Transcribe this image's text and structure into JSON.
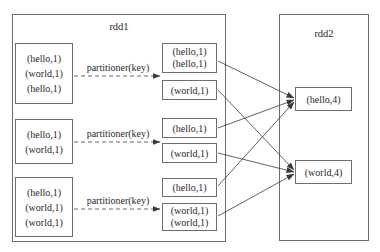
{
  "rdd1": {
    "title": "rdd1",
    "input_partitions": [
      {
        "records": [
          "(hello,1)",
          "(world,1)",
          "(hello,1)"
        ]
      },
      {
        "records": [
          "(hello,1)",
          "(world,1)"
        ]
      },
      {
        "records": [
          "(hello,1)",
          "(world,1)",
          "(world,1)"
        ]
      }
    ],
    "partitioner_labels": [
      "partitioner(key)",
      "partitioner(key)",
      "partitioner(key)"
    ],
    "buckets": [
      {
        "records": [
          "(hello,1)",
          "(hello,1)"
        ],
        "target": "hello"
      },
      {
        "records": [
          "(world,1)"
        ],
        "target": "world"
      },
      {
        "records": [
          "(hello,1)"
        ],
        "target": "hello"
      },
      {
        "records": [
          "(world,1)"
        ],
        "target": "world"
      },
      {
        "records": [
          "(hello,1)"
        ],
        "target": "hello"
      },
      {
        "records": [
          "(world,1)",
          "(world,1)"
        ],
        "target": "world"
      }
    ]
  },
  "rdd2": {
    "title": "rdd2",
    "results": [
      {
        "record": "(hello,4)"
      },
      {
        "record": "(world,4)"
      }
    ]
  },
  "colors": {
    "border": "#6e6e6e",
    "arrow": "#3a3a3a",
    "text": "#2a2a2a",
    "background": "#ffffff"
  }
}
